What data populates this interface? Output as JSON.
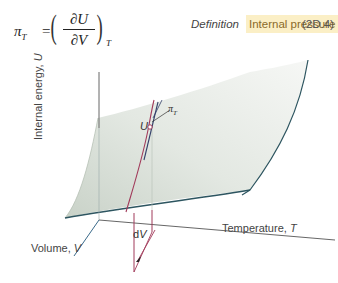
{
  "equation": {
    "lhs_symbol": "π",
    "lhs_subscript": "T",
    "equals": "=",
    "numerator": "∂U",
    "denominator": "∂V",
    "constant_subscript": "T",
    "left_paren": "(",
    "right_paren": ")"
  },
  "meta": {
    "definition_label": "Definition",
    "tag_label": "Internal pressure",
    "equation_number": "(2D.4)",
    "tag_color": "#fbefc6"
  },
  "figure": {
    "y_axis_label": "Internal energy, ",
    "y_axis_var": "U",
    "x_axis_label": "Temperature, ",
    "x_axis_var": "T",
    "z_axis_label": "Volume, ",
    "z_axis_var": "V",
    "point_label": "U",
    "slope_label": "π",
    "slope_subscript": "T",
    "increment_label_d": "d",
    "increment_label_var": "V",
    "surface_color": "#d7ddd6",
    "edge_color": "#2d5560",
    "path_color": "#a13a5a"
  }
}
